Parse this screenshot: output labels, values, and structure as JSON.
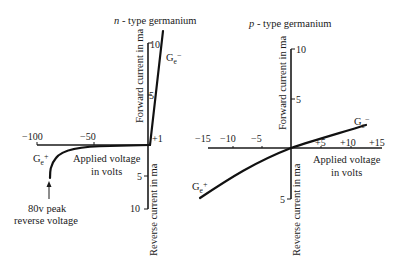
{
  "left": {
    "title_italic": "n",
    "title_rest": " - type germanium",
    "forward_label": "Forward current in ma",
    "reverse_label": "Reverse current in ma",
    "x_label_line1": "Applied voltage",
    "x_label_line2": "in volts",
    "fwd_ticks": [
      "10",
      "5"
    ],
    "rev_ticks": [
      "5",
      "10"
    ],
    "x_ticks": [
      "−100",
      "−50",
      "+1"
    ],
    "curve_fwd_label": "G",
    "curve_fwd_sub": "e",
    "curve_fwd_sign": "−",
    "curve_rev_label": "G",
    "curve_rev_sub": "e",
    "curve_rev_sign": "+",
    "annotation_line1": "80v peak",
    "annotation_line2": "reverse voltage"
  },
  "right": {
    "title_italic": "p",
    "title_rest": " - type germanium",
    "forward_label": "Forward current in ma",
    "reverse_label": "Reverse current in ma",
    "x_label_line1": "Applied voltage",
    "x_label_line2": "in volts",
    "fwd_ticks": [
      "10",
      "5"
    ],
    "rev_ticks": [
      "5"
    ],
    "x_ticks_neg": [
      "−15",
      "−10",
      "−5"
    ],
    "x_ticks_pos": [
      "+5",
      "+10",
      "+15"
    ],
    "curve_fwd_label": "G",
    "curve_fwd_sub": "e",
    "curve_fwd_sign": "−",
    "curve_rev_label": "G",
    "curve_rev_sub": "e",
    "curve_rev_sign": "+"
  }
}
